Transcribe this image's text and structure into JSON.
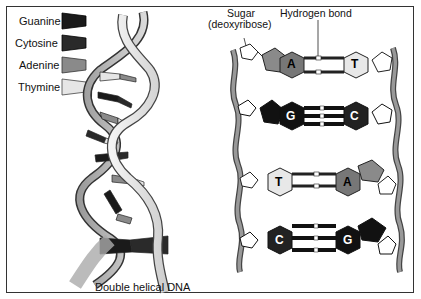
{
  "legend": {
    "items": [
      {
        "label": "Guanine",
        "color": "#1a1a1a"
      },
      {
        "label": "Cytosine",
        "color": "#2a2a2a"
      },
      {
        "label": "Adenine",
        "color": "#8a8a8a"
      },
      {
        "label": "Thymine",
        "color": "#e6e6e6"
      }
    ]
  },
  "labels": {
    "sugar_line1": "Sugar",
    "sugar_line2": "(deoxyribose)",
    "hydrogen_bond": "Hydrogen bond",
    "double_helix": "Double helical DNA"
  },
  "base_pairs": [
    {
      "left": "A",
      "right": "T"
    },
    {
      "left": "G",
      "right": "C"
    },
    {
      "left": "T",
      "right": "A"
    },
    {
      "left": "C",
      "right": "G"
    }
  ]
}
